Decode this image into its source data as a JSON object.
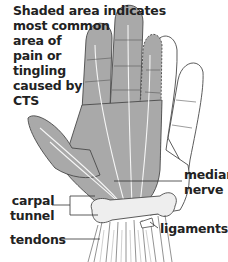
{
  "diagram": {
    "caption": {
      "lines": [
        "Shaded area indicates",
        "most common",
        "area of",
        "pain or",
        "tingling",
        "caused by",
        "CTS"
      ]
    },
    "labels": {
      "median_nerve": [
        "median",
        "nerve"
      ],
      "carpal_tunnel": [
        "carpal",
        "tunnel"
      ],
      "ligaments": "ligaments",
      "tendons": "tendons"
    },
    "colors": {
      "shaded_area": "#a9a9a9",
      "outline": "#4a4a4a",
      "text": "#222222",
      "background": "#ffffff"
    }
  }
}
